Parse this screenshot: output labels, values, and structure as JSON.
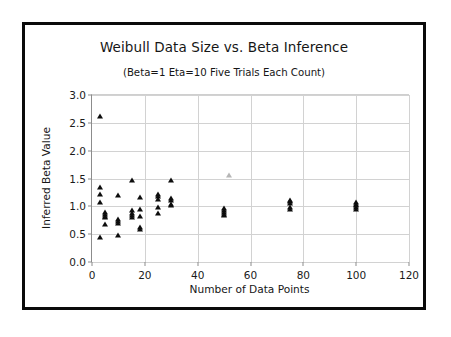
{
  "chart_data": {
    "type": "scatter",
    "title": "Weibull Data Size vs. Beta Inference",
    "subtitle": "(Beta=1  Eta=10 Five Trials Each Count)",
    "xlabel": "Number of Data Points",
    "ylabel": "Inferred Beta Value",
    "xlim": [
      0,
      120
    ],
    "ylim": [
      0.0,
      3.0
    ],
    "xticks": [
      "0",
      "20",
      "40",
      "60",
      "80",
      "100",
      "120"
    ],
    "xtick_values": [
      0,
      20,
      40,
      60,
      80,
      100,
      120
    ],
    "yticks": [
      "0.0",
      "0.5",
      "1.0",
      "1.5",
      "2.0",
      "2.5",
      "3.0"
    ],
    "ytick_values": [
      0.0,
      0.5,
      1.0,
      1.5,
      2.0,
      2.5,
      3.0
    ],
    "grid": true,
    "legend": null,
    "marker": "triangle",
    "marker_color": "#0d0d0d",
    "series": [
      {
        "name": "Inferred Beta",
        "points": [
          {
            "x": 3,
            "y": 2.63
          },
          {
            "x": 3,
            "y": 1.35
          },
          {
            "x": 3,
            "y": 1.22
          },
          {
            "x": 3,
            "y": 1.08
          },
          {
            "x": 3,
            "y": 0.45
          },
          {
            "x": 5,
            "y": 0.9
          },
          {
            "x": 5,
            "y": 0.86
          },
          {
            "x": 5,
            "y": 0.83
          },
          {
            "x": 5,
            "y": 0.8
          },
          {
            "x": 5,
            "y": 0.68
          },
          {
            "x": 10,
            "y": 1.2
          },
          {
            "x": 10,
            "y": 0.78
          },
          {
            "x": 10,
            "y": 0.74
          },
          {
            "x": 10,
            "y": 0.7
          },
          {
            "x": 10,
            "y": 0.48
          },
          {
            "x": 15,
            "y": 1.47
          },
          {
            "x": 15,
            "y": 0.93
          },
          {
            "x": 15,
            "y": 0.88
          },
          {
            "x": 15,
            "y": 0.84
          },
          {
            "x": 15,
            "y": 0.8
          },
          {
            "x": 18,
            "y": 1.17
          },
          {
            "x": 18,
            "y": 0.95
          },
          {
            "x": 18,
            "y": 0.83
          },
          {
            "x": 18,
            "y": 0.62
          },
          {
            "x": 18,
            "y": 0.6
          },
          {
            "x": 25,
            "y": 1.22
          },
          {
            "x": 25,
            "y": 1.18
          },
          {
            "x": 25,
            "y": 1.14
          },
          {
            "x": 25,
            "y": 0.98
          },
          {
            "x": 25,
            "y": 0.88
          },
          {
            "x": 30,
            "y": 1.48
          },
          {
            "x": 30,
            "y": 1.15
          },
          {
            "x": 30,
            "y": 1.12
          },
          {
            "x": 30,
            "y": 1.05
          },
          {
            "x": 30,
            "y": 1.02
          },
          {
            "x": 50,
            "y": 0.97
          },
          {
            "x": 50,
            "y": 0.93
          },
          {
            "x": 50,
            "y": 0.9
          },
          {
            "x": 50,
            "y": 0.86
          },
          {
            "x": 50,
            "y": 0.84
          },
          {
            "x": 75,
            "y": 1.12
          },
          {
            "x": 75,
            "y": 1.09
          },
          {
            "x": 75,
            "y": 1.06
          },
          {
            "x": 75,
            "y": 0.98
          },
          {
            "x": 75,
            "y": 0.95
          },
          {
            "x": 100,
            "y": 1.08
          },
          {
            "x": 100,
            "y": 1.05
          },
          {
            "x": 100,
            "y": 1.02
          },
          {
            "x": 100,
            "y": 0.99
          },
          {
            "x": 100,
            "y": 0.96
          }
        ]
      },
      {
        "name": "Faint Outlier",
        "faint": true,
        "points": [
          {
            "x": 52,
            "y": 1.56
          }
        ]
      }
    ]
  }
}
